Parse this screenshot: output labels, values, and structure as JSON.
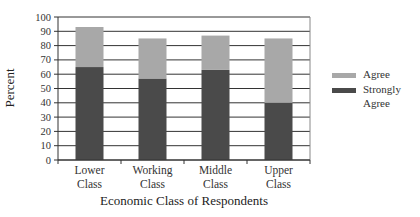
{
  "chart_data": {
    "type": "bar",
    "stacked": true,
    "title": "",
    "xlabel": "Economic Class of Respondents",
    "ylabel": "Percent",
    "ylim": [
      0,
      100
    ],
    "yticks": [
      0,
      10,
      20,
      30,
      40,
      50,
      60,
      70,
      80,
      90,
      100
    ],
    "grid": true,
    "legend_position": "right",
    "categories": [
      [
        "Lower",
        "Class"
      ],
      [
        "Working",
        "Class"
      ],
      [
        "Middle",
        "Class"
      ],
      [
        "Upper",
        "Class"
      ]
    ],
    "series": [
      {
        "name": "Strongly Agree",
        "legend_lines": [
          "Strongly",
          "Agree"
        ],
        "color": "#4a4a4a",
        "values": [
          65,
          57,
          63,
          40
        ]
      },
      {
        "name": "Agree",
        "legend_lines": [
          "Agree"
        ],
        "color": "#a8a8a8",
        "values": [
          28,
          28,
          24,
          45
        ]
      }
    ]
  }
}
